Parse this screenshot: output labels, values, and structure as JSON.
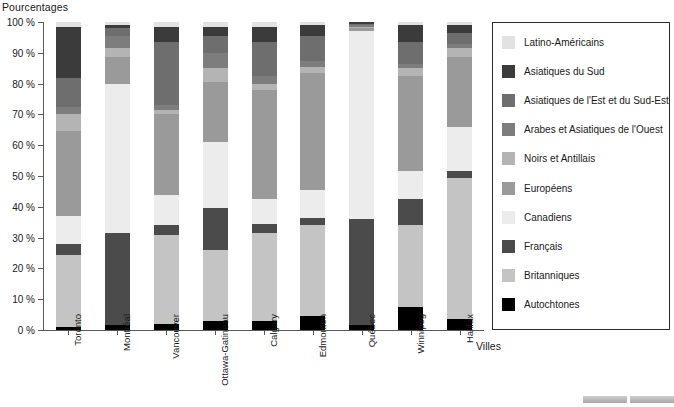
{
  "axes": {
    "y_title": "Pourcentages",
    "x_title": "Villes",
    "y_ticks": [
      "0 %",
      "10 %",
      "20 %",
      "30 %",
      "40 %",
      "50 %",
      "60 %",
      "70 %",
      "80 %",
      "90 %",
      "100 %"
    ]
  },
  "legend": {
    "items": [
      {
        "label": "Latino-Américains",
        "color": "#e2e2e2"
      },
      {
        "label": "Asiatiques du Sud",
        "color": "#3b3b3b"
      },
      {
        "label": "Asiatiques de l'Est et du Sud-Est",
        "color": "#6e6e6e"
      },
      {
        "label": "Arabes et Asiatiques de l'Ouest",
        "color": "#7d7d7d"
      },
      {
        "label": "Noirs et Antillais",
        "color": "#b4b4b4"
      },
      {
        "label": "Européens",
        "color": "#9a9a9a"
      },
      {
        "label": "Canadiens",
        "color": "#ececec"
      },
      {
        "label": "Français",
        "color": "#4b4b4b"
      },
      {
        "label": "Britanniques",
        "color": "#c4c4c4"
      },
      {
        "label": "Autochtones",
        "color": "#000000"
      }
    ]
  },
  "chart_data": {
    "type": "bar",
    "subtype": "stacked-100",
    "title": "",
    "xlabel": "Villes",
    "ylabel": "Pourcentages",
    "ylim": [
      0,
      100
    ],
    "grid": false,
    "legend_position": "right",
    "categories": [
      "Toronto",
      "Montréal",
      "Vancouver",
      "Ottawa-Gatineau",
      "Calgary",
      "Edmonton",
      "Québec",
      "Winnipeg",
      "Halifax"
    ],
    "series": [
      {
        "name": "Autochtones",
        "color": "#000000",
        "values": [
          1.0,
          1.5,
          2.0,
          3.0,
          3.0,
          4.5,
          1.5,
          7.5,
          3.5
        ]
      },
      {
        "name": "Britanniques",
        "color": "#c4c4c4",
        "values": [
          23.5,
          0.0,
          29.0,
          23.0,
          28.5,
          29.5,
          0.0,
          26.5,
          46.0
        ]
      },
      {
        "name": "Français",
        "color": "#4b4b4b",
        "values": [
          3.5,
          30.0,
          3.0,
          13.5,
          3.0,
          2.5,
          34.5,
          8.5,
          2.0
        ]
      },
      {
        "name": "Canadiens",
        "color": "#ececec",
        "values": [
          9.0,
          48.5,
          10.0,
          21.5,
          8.0,
          9.0,
          61.0,
          9.0,
          14.5
        ]
      },
      {
        "name": "Européens",
        "color": "#9a9a9a",
        "values": [
          27.5,
          8.5,
          26.0,
          19.5,
          35.5,
          38.0,
          1.0,
          31.0,
          22.5
        ]
      },
      {
        "name": "Noirs et Antillais",
        "color": "#b4b4b4",
        "values": [
          5.5,
          3.0,
          1.5,
          4.5,
          2.0,
          2.0,
          0.5,
          2.5,
          3.0
        ]
      },
      {
        "name": "Arabes et Asiatiques de l'Ouest",
        "color": "#7d7d7d",
        "values": [
          2.5,
          4.0,
          1.5,
          5.0,
          2.5,
          2.0,
          0.5,
          1.5,
          1.5
        ]
      },
      {
        "name": "Asiatiques de l'Est et du Sud-Est",
        "color": "#6e6e6e",
        "values": [
          9.5,
          2.5,
          20.5,
          5.5,
          11.0,
          8.0,
          0.5,
          7.0,
          3.5
        ]
      },
      {
        "name": "Asiatiques du Sud",
        "color": "#3b3b3b",
        "values": [
          16.5,
          1.0,
          5.0,
          3.0,
          5.0,
          3.5,
          0.5,
          5.5,
          2.5
        ]
      },
      {
        "name": "Latino-Américains",
        "color": "#e2e2e2",
        "values": [
          1.5,
          1.0,
          1.5,
          1.5,
          1.5,
          1.0,
          0.0,
          1.0,
          1.0
        ]
      }
    ]
  }
}
